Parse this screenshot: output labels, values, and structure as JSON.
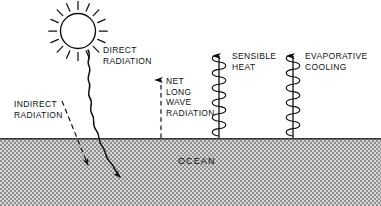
{
  "figure": {
    "background_color": "#ffffff",
    "ink_color": "#111111",
    "ocean_fill_color": "#b6b6b6",
    "width": 381,
    "height": 206
  },
  "labels": {
    "direct_radiation": "DIRECT\nRADIATION",
    "indirect_radiation": "INDIRECT\nRADIATION",
    "net_long_wave_radiation": "NET\nLONG\nWAVE\nRADIATION",
    "sensible_heat": "SENSIBLE\nHEAT",
    "evaporative_cooling": "EVAPORATIVE\nCOOLING",
    "ocean": "OCEAN"
  },
  "elements": {
    "sun": {
      "name": "sun",
      "rays": 16,
      "cx": 78,
      "cy": 31,
      "r": 18
    },
    "direct_radiation_ray": {
      "name": "wavy-arrow",
      "direction": "down-right",
      "style": "solid-wavy"
    },
    "indirect_radiation_ray": {
      "name": "dashed-arrow",
      "direction": "down-right",
      "style": "dashed-straight"
    },
    "net_long_wave_ray": {
      "name": "dashed-arrow",
      "direction": "up",
      "style": "dashed-vertical"
    },
    "sensible_heat_ray": {
      "name": "coil-arrow",
      "direction": "up",
      "style": "helix-spring"
    },
    "evaporative_cooling_ray": {
      "name": "coil-arrow",
      "direction": "up",
      "style": "helix-spring"
    },
    "ocean_surface_y": 138
  }
}
